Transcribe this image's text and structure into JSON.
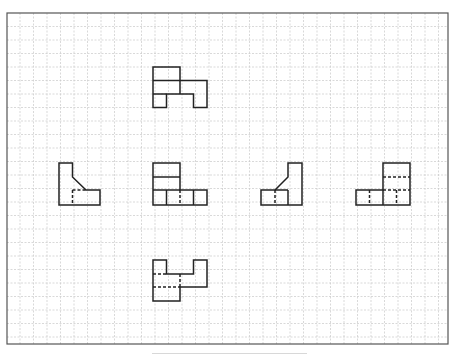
{
  "diagram": {
    "type": "orthographic-projection",
    "colors": {
      "background": "#ffffff",
      "grid": "#c8c8c8",
      "border": "#555555",
      "stroke": "#222222"
    },
    "frame": {
      "x": 7,
      "y": 13,
      "width": 441,
      "height": 331
    },
    "grid": {
      "origin_x": 6.5,
      "origin_y": 13,
      "spacing": 13.5,
      "cols": 33,
      "rows": 25
    },
    "views": [
      {
        "name": "top-view",
        "solid": [
          "M153,67 L180,67 L180,80.5 L207,80.5 L207,107.5 L193.5,107.5 L193.5,94 L166.5,94 L166.5,107.5 L153,107.5 Z",
          "M153,80.5 L180,80.5",
          "M180,80.5 L180,94",
          "M153,94 L166.5,94"
        ],
        "dashed": []
      },
      {
        "name": "left-view",
        "solid": [
          "M59,163 L72.5,163 L72.5,177 L86,190 L100,190 L100,205 L59,205 Z"
        ],
        "dashed": [
          "M72.5,190 L86,190",
          "M72.5,190 L72.5,205"
        ]
      },
      {
        "name": "front-view",
        "solid": [
          "M153,163 L180,163 L180,190 L207,190 L207,205 L153,205 Z",
          "M153,177 L180,177",
          "M153,190 L180,190",
          "M166.5,190 L166.5,205",
          "M193.5,190 L193.5,205"
        ],
        "dashed": [
          "M180,190 L180,205"
        ]
      },
      {
        "name": "right-view",
        "solid": [
          "M288,163 L302,163 L302,205 L261,205 L261,190 L275,190 L288,177 Z",
          "M275,190 L288,190",
          "M288,190 L288,205"
        ],
        "dashed": [
          "M275,190 L275,205"
        ]
      },
      {
        "name": "rear-view",
        "solid": [
          "M383,163 L410,163 L410,205 L356,205 L356,190 L383,190 Z",
          "M383,190 L383,205"
        ],
        "dashed": [
          "M383,177 L410,177",
          "M383,190 L410,190",
          "M369.5,190 L369.5,205",
          "M396.5,190 L396.5,205"
        ]
      },
      {
        "name": "bottom-view",
        "solid": [
          "M153,260 L166.5,260 L166.5,274 L193.5,274 L193.5,260 L207,260 L207,287 L180,287 L180,301 L153,301 Z"
        ],
        "dashed": [
          "M153,274 L166.5,274",
          "M180,274 L180,287",
          "M153,287 L180,287"
        ]
      }
    ]
  }
}
